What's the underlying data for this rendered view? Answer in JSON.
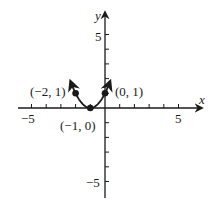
{
  "chart_data": {
    "type": "line",
    "title": "",
    "equation": "y = (x + 1)^2",
    "xlabel": "x",
    "ylabel": "y",
    "xlim": [
      -5.5,
      6.5
    ],
    "ylim": [
      -6,
      6.5
    ],
    "x_ticks": [
      -5,
      -4,
      -3,
      -2,
      -1,
      0,
      1,
      2,
      3,
      4,
      5
    ],
    "y_ticks": [
      -5,
      -4,
      -3,
      -2,
      -1,
      0,
      1,
      2,
      3,
      4,
      5
    ],
    "x_tick_labels": {
      "-5": "−5",
      "5": "5"
    },
    "y_tick_labels": {
      "5": "5",
      "-5": "−5"
    },
    "grid": false,
    "points": [
      {
        "x": -2,
        "y": 1,
        "label": "(−2, 1)"
      },
      {
        "x": -1,
        "y": 0,
        "label": "(−1, 0)"
      },
      {
        "x": 0,
        "y": 1,
        "label": "(0, 1)"
      }
    ],
    "curve_range": [
      -2.35,
      0.35
    ],
    "arrows_at_ends": true
  },
  "labels": {
    "x_axis": "x",
    "y_axis": "y",
    "x_neg5": "−5",
    "x_pos5": "5",
    "y_pos5": "5",
    "y_neg5": "−5",
    "pt_a": "(−2, 1)",
    "pt_b": "(−1, 0)",
    "pt_c": "(0, 1)"
  },
  "colors": {
    "ink": "#1a1a1a",
    "background": "#ffffff"
  }
}
